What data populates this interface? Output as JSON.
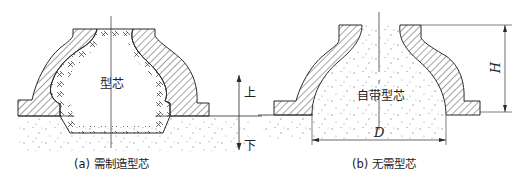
{
  "figure_a": {
    "caption": "(a) 需制造型芯",
    "core_label": "型芯",
    "direction_up": "上",
    "direction_down": "下"
  },
  "figure_b": {
    "caption": "(b) 无需型芯",
    "core_label": "自带型芯",
    "dimension_height": "H",
    "dimension_diameter": "D"
  },
  "colors": {
    "line": "#2a2a2a",
    "sand_dot": "#8a8a8a",
    "background": "#ffffff"
  }
}
